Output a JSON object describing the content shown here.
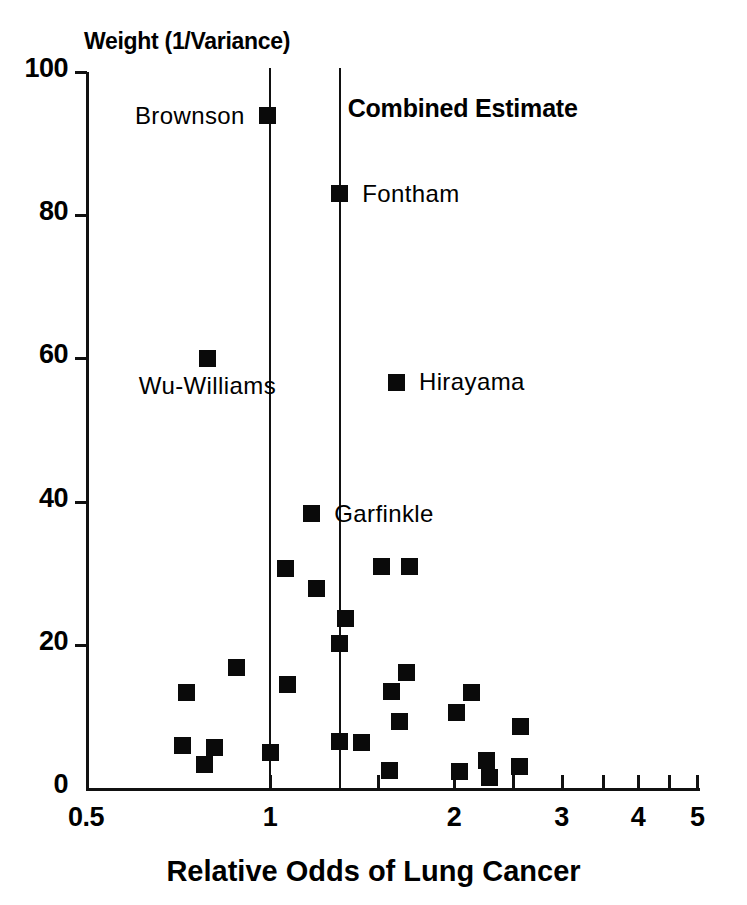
{
  "chart_data": {
    "type": "scatter",
    "title": "",
    "ylabel": "Weight (1/Variance)",
    "xlabel": "Relative Odds of Lung Cancer",
    "xscale": "log",
    "xlim": [
      0.5,
      5
    ],
    "ylim": [
      0,
      100
    ],
    "xticks": [
      "0.5",
      "1",
      "2",
      "3",
      "4",
      "5"
    ],
    "xtick_values": [
      0.5,
      1,
      2,
      3,
      4,
      5
    ],
    "xminor_ticks": [
      1.5,
      2.5,
      3.5,
      4.5
    ],
    "yticks": [
      "0",
      "20",
      "40",
      "60",
      "80",
      "100"
    ],
    "ytick_values": [
      0,
      20,
      40,
      60,
      80,
      100
    ],
    "grid": false,
    "legend": "none",
    "reference_lines": [
      {
        "name": "null-line",
        "x": 1.0,
        "label": ""
      },
      {
        "name": "combined-estimate-line",
        "x": 1.3,
        "label": "Combined Estimate"
      }
    ],
    "annotations": [
      {
        "text": "Combined Estimate",
        "x": 1.32,
        "y": 95
      }
    ],
    "points": [
      {
        "x": 0.99,
        "y": 93.9,
        "label": "Brownson",
        "label_side": "left"
      },
      {
        "x": 1.3,
        "y": 83.0,
        "label": "Fontham",
        "label_side": "right"
      },
      {
        "x": 0.79,
        "y": 60.0,
        "label": "Wu-Williams",
        "label_side": "below"
      },
      {
        "x": 1.61,
        "y": 56.7,
        "label": "Hirayama",
        "label_side": "right"
      },
      {
        "x": 1.17,
        "y": 38.3,
        "label": "Garfinkle",
        "label_side": "right"
      },
      {
        "x": 1.06,
        "y": 30.6,
        "label": "",
        "label_side": ""
      },
      {
        "x": 1.52,
        "y": 30.9,
        "label": "",
        "label_side": ""
      },
      {
        "x": 1.69,
        "y": 30.9,
        "label": "",
        "label_side": ""
      },
      {
        "x": 1.19,
        "y": 27.8,
        "label": "",
        "label_side": ""
      },
      {
        "x": 1.33,
        "y": 23.7,
        "label": "",
        "label_side": ""
      },
      {
        "x": 1.3,
        "y": 20.2,
        "label": "",
        "label_side": ""
      },
      {
        "x": 1.67,
        "y": 16.2,
        "label": "",
        "label_side": ""
      },
      {
        "x": 0.88,
        "y": 16.8,
        "label": "",
        "label_side": ""
      },
      {
        "x": 1.58,
        "y": 13.5,
        "label": "",
        "label_side": ""
      },
      {
        "x": 0.73,
        "y": 13.4,
        "label": "",
        "label_side": ""
      },
      {
        "x": 2.14,
        "y": 13.3,
        "label": "",
        "label_side": ""
      },
      {
        "x": 1.07,
        "y": 14.4,
        "label": "",
        "label_side": ""
      },
      {
        "x": 1.63,
        "y": 9.3,
        "label": "",
        "label_side": ""
      },
      {
        "x": 2.02,
        "y": 10.5,
        "label": "",
        "label_side": ""
      },
      {
        "x": 2.57,
        "y": 8.6,
        "label": "",
        "label_side": ""
      },
      {
        "x": 1.3,
        "y": 6.5,
        "label": "",
        "label_side": ""
      },
      {
        "x": 1.41,
        "y": 6.4,
        "label": "",
        "label_side": ""
      },
      {
        "x": 1.0,
        "y": 5.0,
        "label": "",
        "label_side": ""
      },
      {
        "x": 0.72,
        "y": 5.9,
        "label": "",
        "label_side": ""
      },
      {
        "x": 0.81,
        "y": 5.6,
        "label": "",
        "label_side": ""
      },
      {
        "x": 0.78,
        "y": 3.3,
        "label": "",
        "label_side": ""
      },
      {
        "x": 1.57,
        "y": 2.5,
        "label": "",
        "label_side": ""
      },
      {
        "x": 2.04,
        "y": 2.3,
        "label": "",
        "label_side": ""
      },
      {
        "x": 2.26,
        "y": 3.8,
        "label": "",
        "label_side": ""
      },
      {
        "x": 2.29,
        "y": 1.4,
        "label": "",
        "label_side": ""
      },
      {
        "x": 2.56,
        "y": 3.0,
        "label": "",
        "label_side": ""
      }
    ]
  },
  "axes": {
    "y_title": "Weight (1/Variance)",
    "x_title": "Relative Odds of Lung Cancer"
  }
}
